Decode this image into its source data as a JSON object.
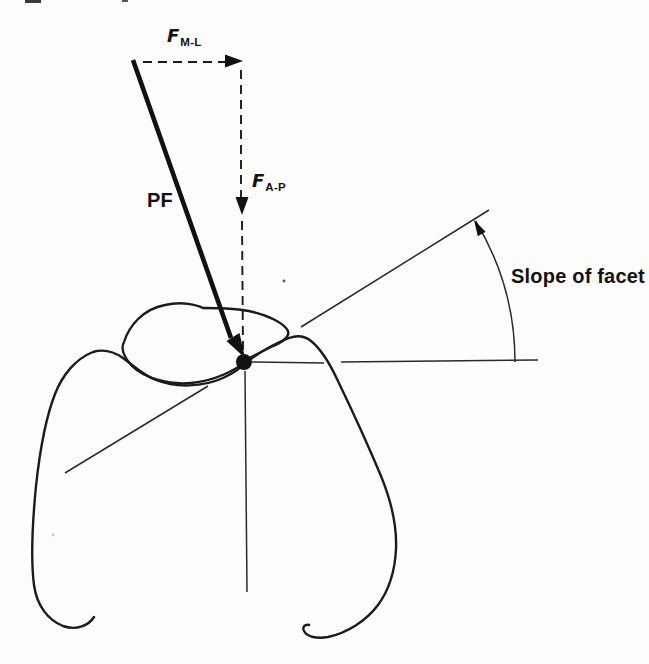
{
  "figure": {
    "type": "biomechanics-force-diagram",
    "background_color": "#fefdfb",
    "ink_color": "#1b1b1b",
    "labels": {
      "resultant_force": "PF",
      "force_ml": {
        "symbol": "F",
        "subscript": "M-L"
      },
      "force_ap": {
        "symbol": "F",
        "subscript": "A-P"
      },
      "facet_angle": "Slope of facet"
    }
  }
}
